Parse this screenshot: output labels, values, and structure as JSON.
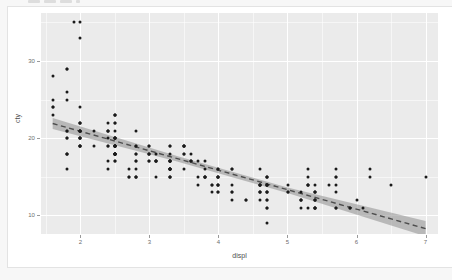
{
  "figure": {
    "top_sliver_note": "cropped-toolbar-chips",
    "panel_bg": "#ebebeb",
    "grid_color": "#ffffff",
    "point_color": "#1a1a1a",
    "line_color": "#4d4d4d",
    "ribbon_color": "#9a9a9a",
    "card_bg": "#ffffff",
    "page_bg": "#f7f7f7"
  },
  "chart_data": {
    "type": "scatter",
    "title": "",
    "subtitle": "",
    "xlabel": "displ",
    "ylabel": "cty",
    "xlim": [
      1.43,
      7.18
    ],
    "ylim": [
      7.6,
      36.2
    ],
    "xticks": [
      2,
      3,
      4,
      5,
      6,
      7
    ],
    "xtick_labels": [
      "2",
      "3",
      "4",
      "5",
      "6",
      "7"
    ],
    "yticks": [
      10,
      20,
      30
    ],
    "ytick_labels": [
      "10",
      "20",
      "30"
    ],
    "x_minor_ticks": [
      1.5,
      2.5,
      3.5,
      4.5,
      5.5,
      6.5
    ],
    "y_minor_ticks": [
      15,
      25,
      35
    ],
    "grid": true,
    "legend": "none",
    "smooth": {
      "method": "lm",
      "linetype": "dashed",
      "se": true,
      "line_endpoints": [
        [
          1.6,
          21.9
        ],
        [
          7.0,
          8.3
        ]
      ],
      "band_lower": [
        [
          1.6,
          21.2
        ],
        [
          3.4,
          17.0
        ],
        [
          5.0,
          12.9
        ],
        [
          7.0,
          7.3
        ]
      ],
      "band_upper": [
        [
          1.6,
          22.6
        ],
        [
          3.4,
          17.7
        ],
        [
          5.0,
          13.6
        ],
        [
          7.0,
          9.3
        ]
      ]
    },
    "points": [
      [
        1.8,
        18
      ],
      [
        1.8,
        21
      ],
      [
        2.0,
        20
      ],
      [
        2.0,
        21
      ],
      [
        2.8,
        16
      ],
      [
        2.8,
        18
      ],
      [
        3.1,
        18
      ],
      [
        1.8,
        18
      ],
      [
        1.8,
        16
      ],
      [
        2.0,
        20
      ],
      [
        2.0,
        19
      ],
      [
        2.8,
        15
      ],
      [
        2.8,
        17
      ],
      [
        3.1,
        17
      ],
      [
        3.1,
        15
      ],
      [
        2.8,
        15
      ],
      [
        3.1,
        17
      ],
      [
        4.2,
        16
      ],
      [
        5.3,
        14
      ],
      [
        5.3,
        11
      ],
      [
        5.3,
        14
      ],
      [
        5.7,
        13
      ],
      [
        6.0,
        12
      ],
      [
        5.7,
        16
      ],
      [
        5.7,
        15
      ],
      [
        6.2,
        16
      ],
      [
        6.2,
        15
      ],
      [
        7.0,
        15
      ],
      [
        5.3,
        16
      ],
      [
        5.3,
        15
      ],
      [
        5.7,
        15
      ],
      [
        6.5,
        14
      ],
      [
        2.4,
        17
      ],
      [
        2.4,
        19
      ],
      [
        3.1,
        17
      ],
      [
        3.5,
        19
      ],
      [
        3.6,
        17
      ],
      [
        2.4,
        16
      ],
      [
        3.0,
        17
      ],
      [
        3.3,
        16
      ],
      [
        3.3,
        17
      ],
      [
        3.3,
        15
      ],
      [
        3.3,
        16
      ],
      [
        3.8,
        15
      ],
      [
        3.8,
        17
      ],
      [
        3.8,
        15
      ],
      [
        4.0,
        15
      ],
      [
        3.7,
        15
      ],
      [
        3.7,
        14
      ],
      [
        3.9,
        13
      ],
      [
        3.9,
        14
      ],
      [
        4.7,
        14
      ],
      [
        4.7,
        14
      ],
      [
        4.7,
        13
      ],
      [
        5.2,
        13
      ],
      [
        5.2,
        11
      ],
      [
        3.9,
        14
      ],
      [
        4.7,
        13
      ],
      [
        4.7,
        12
      ],
      [
        4.7,
        12
      ],
      [
        5.2,
        12
      ],
      [
        5.7,
        11
      ],
      [
        5.9,
        11
      ],
      [
        4.7,
        15
      ],
      [
        4.7,
        14
      ],
      [
        4.7,
        13
      ],
      [
        4.7,
        11
      ],
      [
        4.7,
        11
      ],
      [
        4.7,
        9
      ],
      [
        5.2,
        12
      ],
      [
        5.2,
        12
      ],
      [
        5.7,
        11
      ],
      [
        5.9,
        11
      ],
      [
        4.6,
        14
      ],
      [
        5.4,
        12
      ],
      [
        5.4,
        13
      ],
      [
        4.0,
        14
      ],
      [
        4.0,
        13
      ],
      [
        4.0,
        14
      ],
      [
        4.6,
        13
      ],
      [
        5.0,
        13
      ],
      [
        4.2,
        16
      ],
      [
        4.2,
        14
      ],
      [
        4.6,
        13
      ],
      [
        4.6,
        14
      ],
      [
        4.6,
        14
      ],
      [
        5.4,
        11
      ],
      [
        5.4,
        11
      ],
      [
        5.4,
        12
      ],
      [
        5.4,
        13
      ],
      [
        4.0,
        16
      ],
      [
        4.0,
        15
      ],
      [
        4.6,
        16
      ],
      [
        5.0,
        14
      ],
      [
        4.2,
        12
      ],
      [
        4.2,
        13
      ],
      [
        4.4,
        12
      ],
      [
        4.6,
        14
      ],
      [
        5.4,
        14
      ],
      [
        5.4,
        13
      ],
      [
        2.5,
        19
      ],
      [
        2.5,
        20
      ],
      [
        2.5,
        20
      ],
      [
        2.5,
        18
      ],
      [
        2.5,
        18
      ],
      [
        2.5,
        20
      ],
      [
        2.5,
        21
      ],
      [
        2.5,
        19
      ],
      [
        2.5,
        19
      ],
      [
        2.5,
        19
      ],
      [
        2.5,
        23
      ],
      [
        2.5,
        18
      ],
      [
        2.5,
        18
      ],
      [
        2.5,
        20
      ],
      [
        2.2,
        19
      ],
      [
        2.2,
        21
      ],
      [
        2.4,
        20
      ],
      [
        2.4,
        21
      ],
      [
        3.0,
        18
      ],
      [
        3.0,
        18
      ],
      [
        3.5,
        19
      ],
      [
        3.3,
        19
      ],
      [
        3.3,
        17
      ],
      [
        3.3,
        15
      ],
      [
        4.0,
        15
      ],
      [
        5.6,
        14
      ],
      [
        3.1,
        17
      ],
      [
        3.8,
        16
      ],
      [
        3.8,
        15
      ],
      [
        3.8,
        15
      ],
      [
        5.3,
        14
      ],
      [
        2.5,
        17
      ],
      [
        2.5,
        18
      ],
      [
        2.5,
        17
      ],
      [
        2.5,
        18
      ],
      [
        3.5,
        16
      ],
      [
        3.5,
        18
      ],
      [
        3.0,
        18
      ],
      [
        3.3,
        17
      ],
      [
        3.3,
        16
      ],
      [
        3.3,
        18
      ],
      [
        3.3,
        16
      ],
      [
        1.8,
        18
      ],
      [
        1.8,
        20
      ],
      [
        2.0,
        20
      ],
      [
        2.0,
        22
      ],
      [
        2.8,
        17
      ],
      [
        2.8,
        19
      ],
      [
        3.6,
        18
      ],
      [
        1.8,
        20
      ],
      [
        1.8,
        21
      ],
      [
        2.0,
        19
      ],
      [
        2.0,
        22
      ],
      [
        2.8,
        15
      ],
      [
        2.8,
        18
      ],
      [
        3.6,
        17
      ],
      [
        1.6,
        28
      ],
      [
        1.6,
        24
      ],
      [
        1.6,
        25
      ],
      [
        1.6,
        23
      ],
      [
        1.6,
        24
      ],
      [
        1.8,
        26
      ],
      [
        1.8,
        25
      ],
      [
        2.0,
        24
      ],
      [
        2.4,
        21
      ],
      [
        2.4,
        22
      ],
      [
        2.5,
        23
      ],
      [
        2.5,
        22
      ],
      [
        3.3,
        16
      ],
      [
        2.0,
        20
      ],
      [
        2.0,
        19
      ],
      [
        2.0,
        21
      ],
      [
        2.0,
        21
      ],
      [
        2.7,
        16
      ],
      [
        2.7,
        15
      ],
      [
        2.7,
        15
      ],
      [
        3.0,
        17
      ],
      [
        3.7,
        17
      ],
      [
        4.0,
        16
      ],
      [
        4.7,
        15
      ],
      [
        4.7,
        15
      ],
      [
        4.7,
        14
      ],
      [
        5.7,
        14
      ],
      [
        6.1,
        11
      ],
      [
        4.0,
        15
      ],
      [
        4.2,
        13
      ],
      [
        4.4,
        12
      ],
      [
        4.6,
        12
      ],
      [
        5.4,
        11
      ],
      [
        5.4,
        11
      ],
      [
        5.4,
        12
      ],
      [
        4.0,
        14
      ],
      [
        4.0,
        13
      ],
      [
        4.6,
        13
      ],
      [
        5.0,
        13
      ],
      [
        2.4,
        21
      ],
      [
        2.4,
        19
      ],
      [
        2.5,
        23
      ],
      [
        2.5,
        22
      ],
      [
        3.5,
        19
      ],
      [
        3.5,
        18
      ],
      [
        3.0,
        19
      ],
      [
        3.0,
        19
      ],
      [
        3.5,
        19
      ],
      [
        3.3,
        19
      ],
      [
        3.3,
        17
      ],
      [
        3.3,
        17
      ],
      [
        3.3,
        15
      ],
      [
        3.3,
        16
      ],
      [
        1.8,
        29
      ],
      [
        1.8,
        29
      ],
      [
        2.0,
        33
      ],
      [
        2.0,
        35
      ],
      [
        2.8,
        21
      ],
      [
        2.8,
        19
      ],
      [
        1.9,
        35
      ],
      [
        3.6,
        17
      ],
      [
        2.0,
        21
      ],
      [
        2.0,
        19
      ],
      [
        2.0,
        22
      ],
      [
        2.0,
        21
      ],
      [
        2.5,
        20
      ],
      [
        2.5,
        19
      ],
      [
        2.5,
        18
      ],
      [
        2.5,
        18
      ],
      [
        2.5,
        19
      ],
      [
        2.5,
        19
      ],
      [
        2.5,
        18
      ]
    ]
  }
}
